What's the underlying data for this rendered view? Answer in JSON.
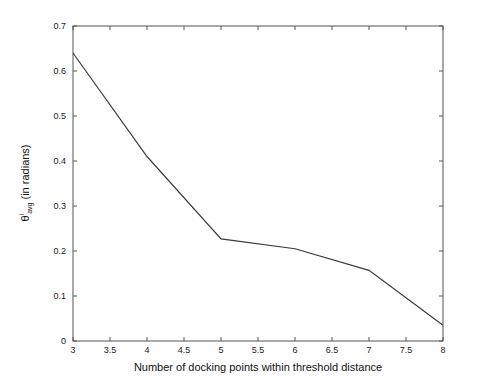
{
  "chart_data": {
    "type": "line",
    "title": "",
    "subtitle": "",
    "xlabel": "Number of docking points within threshold distance",
    "ylabel_theta": "θ",
    "ylabel_sup": "i",
    "ylabel_sub": "avg",
    "ylabel_rest": "(in radians)",
    "ylabel_full": "θi avg (in radians)",
    "x": [
      3,
      4,
      5,
      6,
      7,
      8
    ],
    "values": [
      0.64,
      0.41,
      0.227,
      0.205,
      0.157,
      0.035
    ],
    "series": [
      {
        "name": "theta_avg",
        "values": [
          0.64,
          0.41,
          0.227,
          0.205,
          0.157,
          0.035
        ]
      }
    ],
    "xlim": [
      3,
      8
    ],
    "ylim": [
      0,
      0.7
    ],
    "xticks": [
      3,
      3.5,
      4,
      4.5,
      5,
      5.5,
      6,
      6.5,
      7,
      7.5,
      8
    ],
    "xticklabels": [
      "3",
      "3.5",
      "4",
      "4.5",
      "5",
      "5.5",
      "6",
      "6.5",
      "7",
      "7.5",
      "8"
    ],
    "yticks": [
      0,
      0.1,
      0.2,
      0.3,
      0.4,
      0.5,
      0.6,
      0.7
    ],
    "yticklabels": [
      "0",
      "0.1",
      "0.2",
      "0.3",
      "0.4",
      "0.5",
      "0.6",
      "0.7"
    ],
    "grid": false,
    "legend": false,
    "line_color": "#3b3b3b",
    "axis_color": "#555555",
    "background": "#ffffff",
    "markers": false
  }
}
